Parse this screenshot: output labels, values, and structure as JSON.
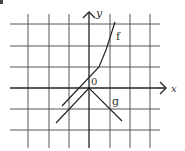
{
  "figure": {
    "type": "coordinate-graph",
    "grid": {
      "vertical_x": [
        28,
        49,
        69,
        110,
        130,
        150
      ],
      "horizontal_y": [
        24,
        46,
        67,
        109,
        130
      ],
      "x_range": [
        10,
        160
      ],
      "y_range": [
        14,
        148
      ],
      "color": "#555555"
    },
    "axes": {
      "origin_px": [
        89,
        88
      ],
      "x_axis": {
        "from": [
          10,
          88
        ],
        "to": [
          166,
          88
        ],
        "label": "x"
      },
      "y_axis": {
        "from": [
          89,
          148
        ],
        "to": [
          89,
          12
        ],
        "label": "y"
      },
      "origin_label": "0",
      "color": "#222222"
    },
    "curves": [
      {
        "name": "f",
        "label": "f",
        "points": [
          [
            62,
            106
          ],
          [
            99,
            67
          ],
          [
            106,
            50
          ],
          [
            115,
            22
          ]
        ],
        "label_pos": [
          116,
          38
        ]
      },
      {
        "name": "g",
        "label": "g",
        "points": [
          [
            56,
            123
          ],
          [
            89,
            88
          ],
          [
            122,
            121
          ]
        ],
        "label_pos": [
          112,
          103
        ]
      }
    ],
    "labels": {
      "x": "x",
      "y": "y",
      "origin": "0",
      "f": "f",
      "g": "g"
    }
  }
}
